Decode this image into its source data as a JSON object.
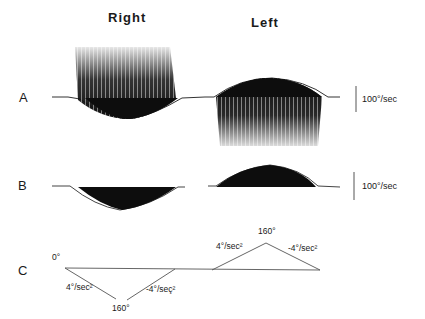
{
  "figure": {
    "column_titles": {
      "right": "Right",
      "left": "Left"
    },
    "panels": {
      "A": {
        "label": "A",
        "scale_bar": "100°/sec"
      },
      "B": {
        "label": "B",
        "scale_bar": "100°/sec"
      },
      "C": {
        "label": "C",
        "start_angle": "0°",
        "right_rotation": {
          "peak": "160°",
          "accel": "4°/sec²",
          "decel": "-4°/seç²"
        },
        "left_rotation": {
          "peak": "160°",
          "accel": "4°/sec²",
          "decel": "-4°/sec²"
        }
      }
    },
    "colors": {
      "ink": "#1a1a1a",
      "background": "#ffffff",
      "trace_line": "#555555"
    }
  }
}
